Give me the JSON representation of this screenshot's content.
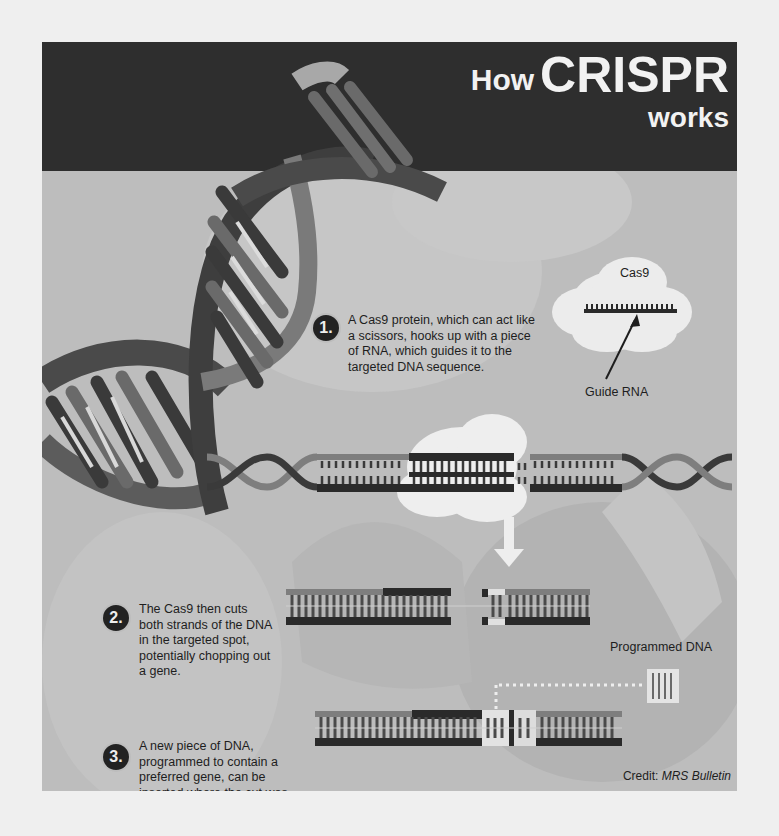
{
  "title": {
    "prefix": "How",
    "main": "CRISPR",
    "suffix": "works"
  },
  "cas9_diagram": {
    "cloud_label": "Cas9",
    "pointer_label": "Guide RNA"
  },
  "steps": [
    {
      "number": "1.",
      "text_lines": [
        "A Cas9 protein, which can act like",
        "a scissors, hooks up with a piece",
        "of RNA, which guides it to the",
        "targeted DNA sequence."
      ]
    },
    {
      "number": "2.",
      "text_lines": [
        "The Cas9 then cuts",
        "both strands of the DNA",
        "in the targeted spot,",
        "potentially chopping out",
        "a gene."
      ]
    },
    {
      "number": "3.",
      "text_lines": [
        "A new piece of DNA,",
        "programmed to contain a",
        "preferred gene, can be",
        "inserted where the cut was",
        "made."
      ]
    }
  ],
  "programmed_dna_label": "Programmed DNA",
  "credit": {
    "prefix": "Credit: ",
    "source": "MRS Bulletin"
  },
  "colors": {
    "banner": "#2e2e2e",
    "panel": "#bdbdbd",
    "page": "#efefef",
    "strand_dark": "#2a2a2a",
    "strand_mid": "#6f6f6f",
    "strand_light": "#9a9a9a",
    "cloud": "#eeeeee",
    "highlight": "#e4e4e4"
  }
}
